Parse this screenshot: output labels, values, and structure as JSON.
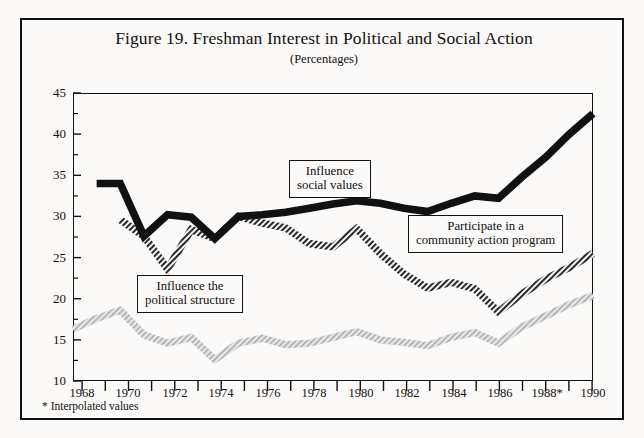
{
  "figure": {
    "title": "Figure 19. Freshman Interest in Political and Social Action",
    "subtitle": "(Percentages)",
    "footnote": "* Interpolated values"
  },
  "callouts": {
    "social_values": {
      "line1": "Influence",
      "line2": "social  values"
    },
    "community_action": {
      "line1": "Participate in a",
      "line2": "community action program"
    },
    "political_structure": {
      "line1": "Influence the",
      "line2": "political  structure"
    }
  },
  "axis": {
    "y_ticks": [
      "45",
      "40",
      "35",
      "30",
      "25",
      "20",
      "15",
      "10"
    ],
    "x_ticks": [
      "1968",
      "1970",
      "1972",
      "1974",
      "1976",
      "1978",
      "1980",
      "1982",
      "1984",
      "1986",
      "1988*",
      "1990"
    ]
  },
  "colors": {
    "series_social_values": "#111111",
    "series_community_action": "#6f6f6f",
    "series_political_structure": "#b4b4b4",
    "frame": "#111111",
    "background": "#fbfaf8"
  },
  "chart_data": {
    "type": "line",
    "title": "Figure 19. Freshman Interest in Political and Social Action",
    "subtitle": "(Percentages)",
    "xlabel": "",
    "ylabel": "Percentages",
    "xlim": [
      1968,
      1990
    ],
    "ylim": [
      10,
      45
    ],
    "y_major_step": 5,
    "y_minor_step": 2.5,
    "grid": false,
    "legend": "inline-callouts",
    "annotations": [
      "Influence social values",
      "Participate in a community action program",
      "Influence the political structure"
    ],
    "footnote": "* Interpolated values",
    "x": [
      1968,
      1969,
      1970,
      1971,
      1972,
      1973,
      1974,
      1975,
      1976,
      1977,
      1978,
      1979,
      1980,
      1981,
      1982,
      1983,
      1984,
      1985,
      1986,
      1987,
      1988,
      1989,
      1990
    ],
    "series": [
      {
        "name": "Influence social values",
        "style": "thick-black",
        "values": [
          null,
          34.0,
          34.0,
          27.6,
          30.2,
          29.9,
          27.3,
          30.0,
          30.2,
          30.5,
          31.0,
          31.5,
          31.9,
          31.6,
          31.0,
          30.6,
          31.6,
          32.5,
          32.2,
          34.8,
          37.2,
          40.0,
          42.5
        ]
      },
      {
        "name": "Participate in a community action program",
        "style": "hatched-dark",
        "values": [
          null,
          null,
          29.6,
          27.6,
          23.6,
          28.4,
          27.3,
          30.0,
          29.2,
          28.6,
          26.7,
          26.3,
          28.5,
          25.5,
          23.0,
          21.3,
          22.0,
          21.2,
          18.4,
          20.6,
          22.4,
          23.8,
          25.5
        ]
      },
      {
        "name": "Influence the political structure",
        "style": "hatched-light",
        "values": [
          16.3,
          17.6,
          18.6,
          15.6,
          14.6,
          15.3,
          12.6,
          14.6,
          15.2,
          14.4,
          14.6,
          15.3,
          16.0,
          15.0,
          14.7,
          14.3,
          15.3,
          15.9,
          14.6,
          16.6,
          17.9,
          19.3,
          20.4
        ]
      }
    ]
  }
}
